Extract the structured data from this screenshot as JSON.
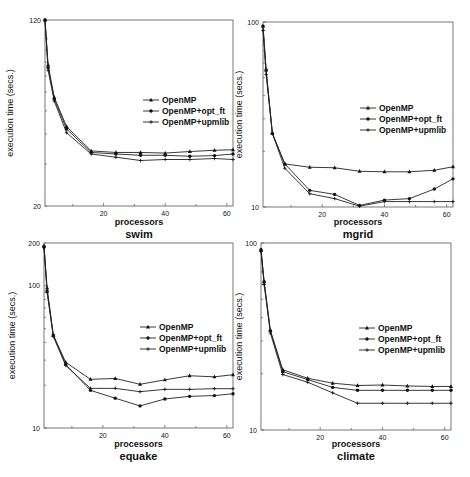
{
  "chart_data": [
    {
      "type": "line",
      "title": "swim",
      "xlabel": "processors",
      "ylabel": "execution time (secs.)",
      "yscale": "log",
      "xlim": [
        1,
        62
      ],
      "ylim": [
        20,
        120
      ],
      "x_ticks": [
        20,
        40,
        60
      ],
      "y_tick_labels": [
        "120",
        "20"
      ],
      "grid": false,
      "legend_position": "right-middle",
      "x": [
        1,
        2,
        4,
        8,
        16,
        24,
        32,
        40,
        48,
        56,
        62
      ],
      "series": [
        {
          "name": "OpenMP",
          "marker": "triangle",
          "values": [
            120,
            78,
            57,
            43,
            34,
            33.5,
            33.5,
            33.3,
            33.8,
            34.2,
            34.4
          ]
        },
        {
          "name": "OpenMP+opt_ft",
          "marker": "circle",
          "values": [
            120,
            76,
            56,
            42,
            33.5,
            33,
            32.6,
            32.6,
            32.3,
            32.5,
            33
          ]
        },
        {
          "name": "OpenMP+upmlib",
          "marker": "cross",
          "values": [
            120,
            74,
            55,
            40.5,
            33,
            32,
            31,
            31.3,
            31.3,
            31.6,
            31.3
          ]
        }
      ]
    },
    {
      "type": "line",
      "title": "mgrid",
      "xlabel": "processors",
      "ylabel": "execution time (secs.)",
      "yscale": "log",
      "xlim": [
        1,
        62
      ],
      "ylim": [
        10,
        100
      ],
      "x_ticks": [
        20,
        40,
        60
      ],
      "y_tick_labels": [
        "100",
        "10"
      ],
      "grid": false,
      "legend_position": "right-middle",
      "x": [
        1,
        2,
        4,
        8,
        16,
        24,
        32,
        40,
        48,
        56,
        62
      ],
      "series": [
        {
          "name": "OpenMP",
          "marker": "triangle",
          "values": [
            95,
            55,
            25,
            17.1,
            16.4,
            16.3,
            15.6,
            15.5,
            15.5,
            15.8,
            16.5
          ]
        },
        {
          "name": "OpenMP+opt_ft",
          "marker": "circle",
          "values": [
            95,
            55,
            25,
            17.1,
            12.3,
            11.7,
            10.2,
            10.9,
            11.1,
            12.5,
            14.2
          ]
        },
        {
          "name": "OpenMP+upmlib",
          "marker": "cross",
          "values": [
            90,
            52,
            25,
            16.2,
            11.8,
            11.1,
            10.1,
            10.7,
            10.7,
            10.7,
            10.7
          ]
        }
      ]
    },
    {
      "type": "line",
      "title": "equake",
      "xlabel": "processors",
      "ylabel": "execution time (secs.)",
      "yscale": "log",
      "xlim": [
        1,
        62
      ],
      "ylim": [
        10,
        200
      ],
      "x_ticks": [
        20,
        40,
        60
      ],
      "y_tick_labels": [
        "200",
        "100",
        "10"
      ],
      "grid": false,
      "legend_position": "right-middle",
      "x": [
        1,
        2,
        4,
        8,
        16,
        24,
        32,
        40,
        48,
        56,
        62
      ],
      "series": [
        {
          "name": "OpenMP",
          "marker": "triangle",
          "values": [
            190,
            97,
            45,
            29,
            22,
            22.3,
            20.3,
            21.8,
            23.3,
            22.9,
            23.7
          ]
        },
        {
          "name": "OpenMP+opt_ft",
          "marker": "circle",
          "values": [
            190,
            92,
            45,
            28,
            18.4,
            16.2,
            14.3,
            16,
            16.7,
            16.9,
            17.4
          ]
        },
        {
          "name": "OpenMP+upmlib",
          "marker": "cross",
          "values": [
            185,
            90,
            44,
            27.5,
            19,
            19,
            18,
            18.7,
            18.7,
            18.9,
            18.9
          ]
        }
      ]
    },
    {
      "type": "line",
      "title": "climate",
      "xlabel": "processors",
      "ylabel": "execution time (secs.)",
      "yscale": "log",
      "xlim": [
        1,
        62
      ],
      "ylim": [
        10,
        100
      ],
      "x_ticks": [
        20,
        40,
        60
      ],
      "y_tick_labels": [
        "100",
        "10"
      ],
      "grid": false,
      "legend_position": "right-middle",
      "x": [
        1,
        2,
        4,
        8,
        16,
        24,
        32,
        40,
        48,
        56,
        62
      ],
      "series": [
        {
          "name": "OpenMP",
          "marker": "triangle",
          "values": [
            92,
            62,
            34,
            21,
            18.9,
            17.8,
            17.3,
            17.4,
            17.2,
            17.1,
            17.1
          ]
        },
        {
          "name": "OpenMP+opt_ft",
          "marker": "circle",
          "values": [
            92,
            62,
            34,
            20.5,
            18.6,
            16.9,
            16.3,
            16.3,
            16.3,
            16.3,
            16.3
          ]
        },
        {
          "name": "OpenMP+upmlib",
          "marker": "cross",
          "values": [
            90,
            60,
            33,
            19.8,
            18,
            15.8,
            13.9,
            13.9,
            13.9,
            13.9,
            13.9
          ]
        }
      ]
    }
  ]
}
